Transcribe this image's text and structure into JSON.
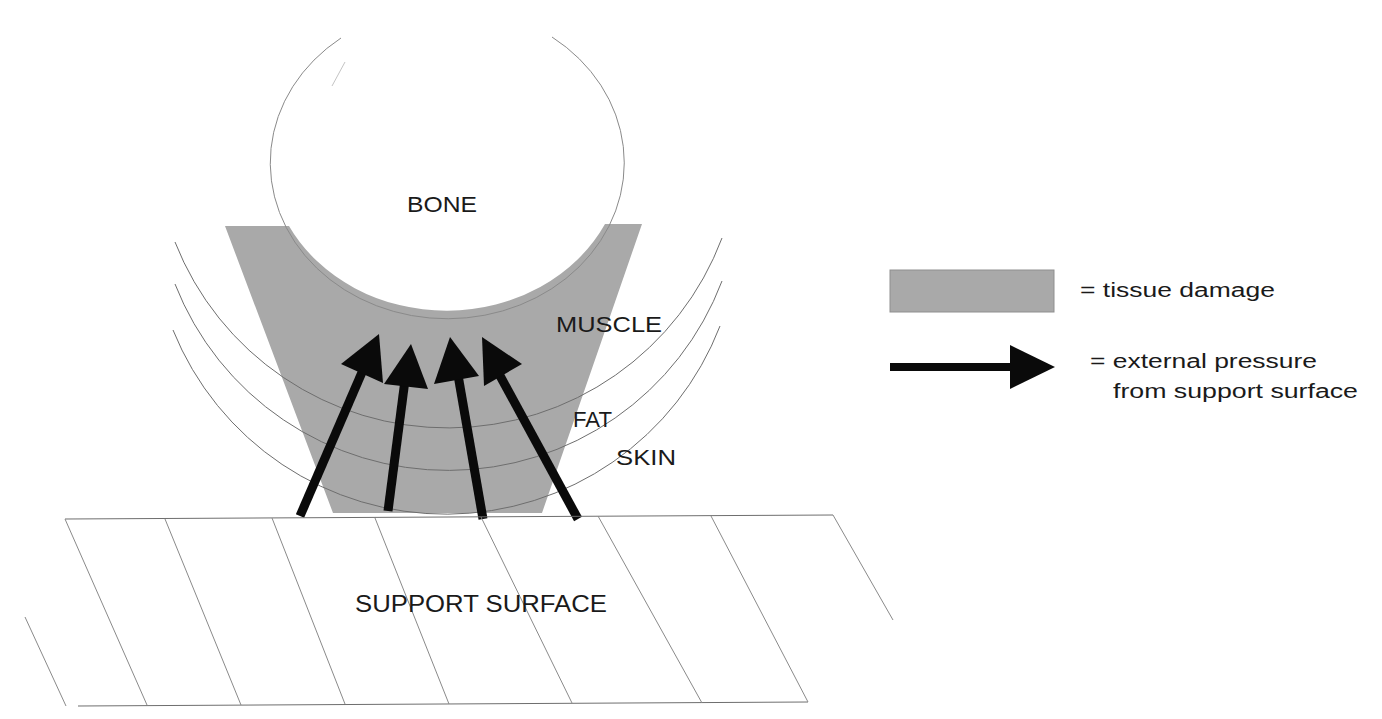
{
  "diagram": {
    "type": "pressure-injury-cross-section",
    "labels": {
      "bone": "BONE",
      "muscle": "MUSCLE",
      "fat": "FAT",
      "skin": "SKIN",
      "support_surface": "SUPPORT SURFACE"
    },
    "tissue_layers": [
      "BONE",
      "MUSCLE",
      "FAT",
      "SKIN"
    ],
    "pressure_arrows": {
      "count": 4,
      "direction": "upward from support surface toward bone"
    },
    "colors": {
      "tissue_damage_fill": "#a9a9a9",
      "arrow": "#0a0a0a",
      "outline": "#8a8a8a",
      "text": "#1a1a1a",
      "background": "#ffffff"
    }
  },
  "legend": {
    "items": [
      {
        "symbol": "gray-rectangle",
        "text": "= tissue damage"
      },
      {
        "symbol": "black-arrow",
        "text_line1": "= external pressure",
        "text_line2": "from support surface"
      }
    ]
  }
}
